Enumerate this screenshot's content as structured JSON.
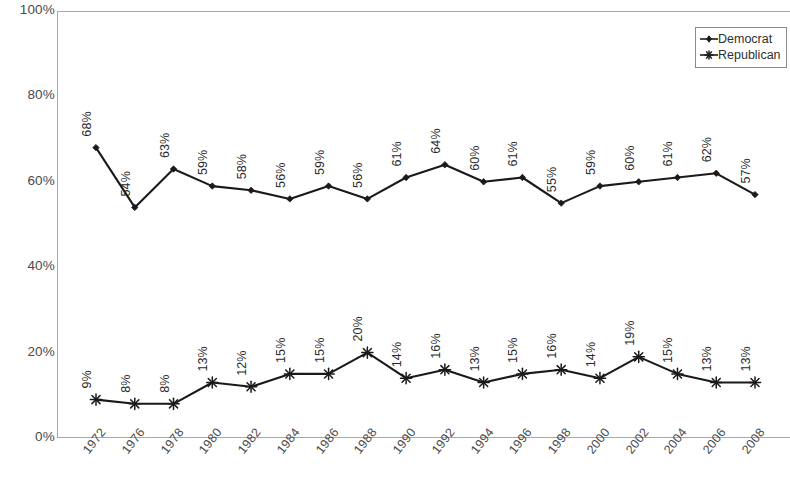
{
  "chart_data": {
    "type": "line",
    "title": "",
    "subtitle": "",
    "xlabel": "",
    "ylabel": "",
    "ylim": [
      0,
      100
    ],
    "grid": false,
    "legend_position": "top-right",
    "y_ticks": [
      "0%",
      "20%",
      "40%",
      "60%",
      "80%",
      "100%"
    ],
    "y_tick_values": [
      0,
      20,
      40,
      60,
      80,
      100
    ],
    "categories": [
      "1972",
      "1976",
      "1978",
      "1980",
      "1982",
      "1984",
      "1986",
      "1988",
      "1990",
      "1992",
      "1994",
      "1996",
      "1998",
      "2000",
      "2002",
      "2004",
      "2006",
      "2008"
    ],
    "series": [
      {
        "name": "Democrat",
        "marker": "diamond",
        "color": "#1a1a1a",
        "values": [
          68,
          54,
          63,
          59,
          58,
          56,
          59,
          56,
          61,
          64,
          60,
          61,
          55,
          59,
          60,
          61,
          62,
          57
        ],
        "labels": [
          "68%",
          "54%",
          "63%",
          "59%",
          "58%",
          "56%",
          "59%",
          "56%",
          "61%",
          "64%",
          "60%",
          "61%",
          "55%",
          "59%",
          "60%",
          "61%",
          "62%",
          "57%"
        ]
      },
      {
        "name": "Republican",
        "marker": "asterisk",
        "color": "#1a1a1a",
        "values": [
          9,
          8,
          8,
          13,
          12,
          15,
          15,
          20,
          14,
          16,
          13,
          15,
          16,
          14,
          19,
          15,
          13,
          13
        ],
        "labels": [
          "9%",
          "8%",
          "8%",
          "13%",
          "12%",
          "15%",
          "15%",
          "20%",
          "14%",
          "16%",
          "13%",
          "15%",
          "16%",
          "14%",
          "19%",
          "15%",
          "13%",
          "13%"
        ]
      }
    ]
  },
  "legend": {
    "items": [
      {
        "label": "Democrat",
        "marker": "diamond"
      },
      {
        "label": "Republican",
        "marker": "asterisk"
      }
    ]
  },
  "colors": {
    "axis": "#a8a8a8",
    "line": "#1a1a1a",
    "text": "#3a3a3a",
    "background": "#ffffff"
  }
}
